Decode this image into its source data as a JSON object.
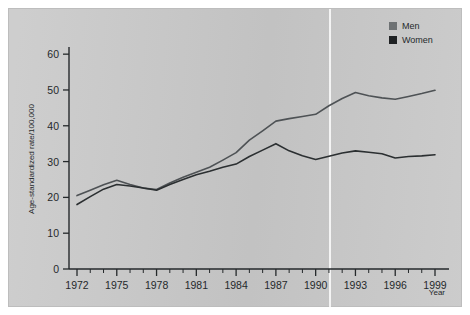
{
  "chart_data": {
    "type": "line",
    "title": "",
    "subtitle": "",
    "xlabel": "Year",
    "ylabel": "Age-standardized rate/100,000",
    "xlim": [
      1972,
      1999
    ],
    "ylim": [
      0,
      62
    ],
    "grid": false,
    "legend_position": "top-right",
    "x": [
      1972,
      1973,
      1974,
      1975,
      1976,
      1977,
      1978,
      1979,
      1980,
      1981,
      1982,
      1983,
      1984,
      1985,
      1986,
      1987,
      1988,
      1989,
      1990,
      1991,
      1992,
      1993,
      1994,
      1995,
      1996,
      1997,
      1998,
      1999
    ],
    "xticks": [
      1972,
      1975,
      1978,
      1981,
      1984,
      1987,
      1990,
      1993,
      1996,
      1999
    ],
    "xticklabels": [
      "1972",
      "1975",
      "1978",
      "1981",
      "1984",
      "1987",
      "1990",
      "1993",
      "1996",
      "1999"
    ],
    "yticks": [
      0,
      10,
      20,
      30,
      40,
      50,
      60
    ],
    "yticklabels": [
      "0",
      "10",
      "20",
      "30",
      "40",
      "50",
      "60"
    ],
    "series": [
      {
        "name": "Men",
        "color": "#4e5255",
        "values": [
          20.5,
          22.0,
          23.5,
          24.8,
          23.6,
          22.6,
          22.2,
          24.0,
          25.6,
          27.0,
          28.4,
          30.4,
          32.5,
          36.0,
          38.6,
          41.3,
          42.0,
          42.6,
          43.2,
          45.6,
          47.6,
          49.3,
          48.4,
          47.8,
          47.4,
          48.2,
          49.0,
          49.9
        ]
      },
      {
        "name": "Women",
        "color": "#2b2f31",
        "values": [
          18.0,
          20.2,
          22.3,
          23.6,
          23.2,
          22.6,
          22.0,
          23.6,
          25.0,
          26.3,
          27.3,
          28.4,
          29.3,
          31.4,
          33.2,
          35.0,
          33.0,
          31.6,
          30.6,
          31.5,
          32.4,
          33.0,
          32.6,
          32.2,
          31.0,
          31.4,
          31.6,
          31.9
        ]
      }
    ],
    "annotations": [],
    "legend": [
      {
        "label": "Men",
        "color": "#6e7274",
        "marker": "square"
      },
      {
        "label": "Women",
        "color": "#1f2224",
        "marker": "square"
      }
    ]
  },
  "figure": {
    "background_color": "#c9c9c9",
    "axis_color": "#25292b",
    "text_color": "#25292b"
  }
}
